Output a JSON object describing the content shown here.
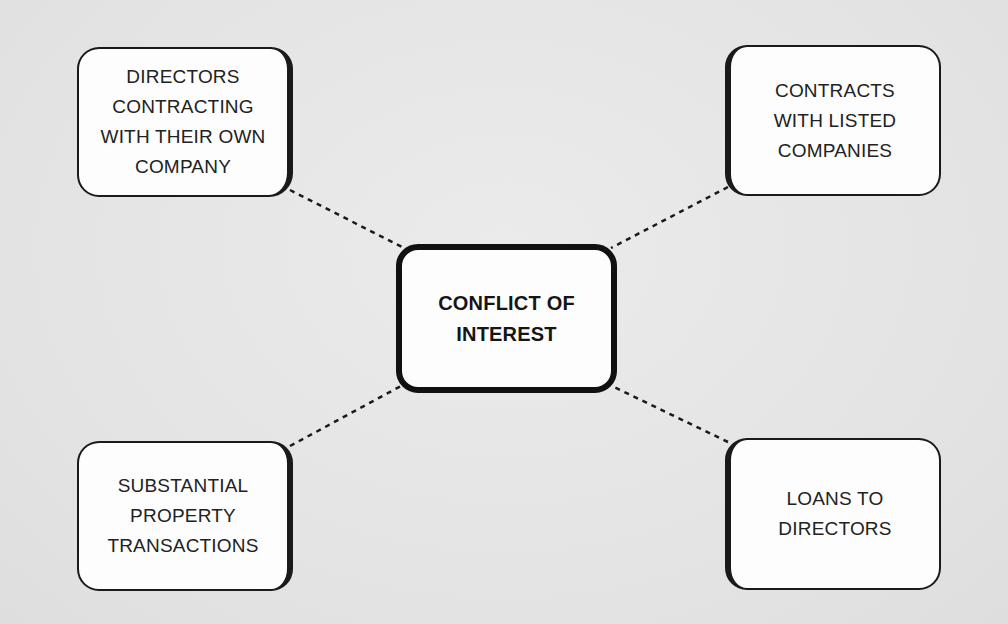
{
  "diagram": {
    "center": {
      "label": "CONFLICT OF\nINTEREST"
    },
    "nodes": [
      {
        "position": "top-left",
        "label": "DIRECTORS\nCONTRACTING\nWITH THEIR OWN\nCOMPANY"
      },
      {
        "position": "top-right",
        "label": "CONTRACTS\nWITH LISTED\nCOMPANIES"
      },
      {
        "position": "bottom-left",
        "label": "SUBSTANTIAL\nPROPERTY\nTRANSACTIONS"
      },
      {
        "position": "bottom-right",
        "label": "LOANS TO\nDIRECTORS"
      }
    ],
    "connector_style": "dashed",
    "colors": {
      "background": "#e6e6e6",
      "box_fill": "#fdfdfd",
      "border": "#1a1a1a"
    }
  }
}
